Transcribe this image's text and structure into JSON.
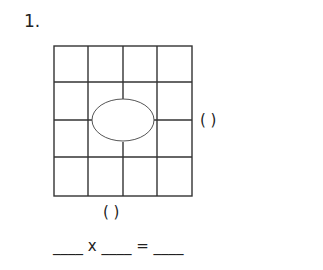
{
  "problem": {
    "number": "1.",
    "grid": {
      "rows": 4,
      "cols": 4,
      "covered_by_oval": true
    },
    "right_paren": "(      )",
    "bottom_paren": "(      )",
    "equation": "____ x ____ = ____"
  }
}
